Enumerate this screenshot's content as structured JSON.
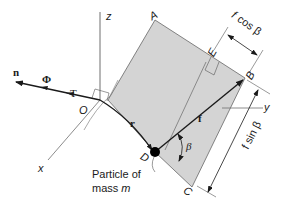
{
  "diagram": {
    "colors": {
      "plane_fill": "#d4d4d4",
      "line": "#1a1a1a",
      "axis": "#6e6e6e",
      "background": "#ffffff"
    },
    "axes": {
      "x": "x",
      "y": "y",
      "z": "z"
    },
    "points": {
      "O": "O",
      "A": "A",
      "B": "B",
      "C": "C",
      "D": "D",
      "E": "E"
    },
    "vectors": {
      "n": "n",
      "Phi": "Φ",
      "T": "T",
      "r": "r",
      "f": "f"
    },
    "angle": "β",
    "dimensions": {
      "fcos_f": "f",
      "fcos_rest": "cos β",
      "fsin": "f sin β"
    },
    "annotation": {
      "line1": "Particle of",
      "line2_prefix": "mass ",
      "line2_var": "m"
    }
  }
}
